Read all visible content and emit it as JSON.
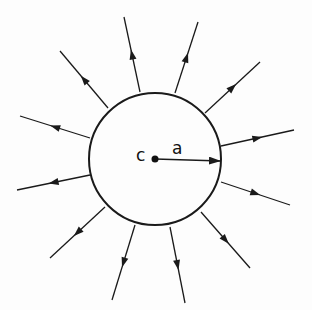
{
  "diagram": {
    "center": {
      "x": 155,
      "y": 159,
      "label": "c"
    },
    "radius": {
      "value": 66,
      "label": "a"
    },
    "colors": {
      "stroke": "#1a1a1a",
      "background": "#fdfdfd"
    },
    "arrows": [
      {
        "x1": 140,
        "y1": 92,
        "x2": 124,
        "y2": 17
      },
      {
        "x1": 175,
        "y1": 93,
        "x2": 198,
        "y2": 22
      },
      {
        "x1": 108,
        "y1": 108,
        "x2": 60,
        "y2": 51
      },
      {
        "x1": 205,
        "y1": 113,
        "x2": 260,
        "y2": 62
      },
      {
        "x1": 90,
        "y1": 138,
        "x2": 20,
        "y2": 116
      },
      {
        "x1": 221,
        "y1": 146,
        "x2": 294,
        "y2": 130
      },
      {
        "x1": 90,
        "y1": 175,
        "x2": 17,
        "y2": 190
      },
      {
        "x1": 221,
        "y1": 182,
        "x2": 290,
        "y2": 205
      },
      {
        "x1": 105,
        "y1": 207,
        "x2": 50,
        "y2": 258
      },
      {
        "x1": 201,
        "y1": 212,
        "x2": 250,
        "y2": 268
      },
      {
        "x1": 135,
        "y1": 225,
        "x2": 112,
        "y2": 300
      },
      {
        "x1": 170,
        "y1": 227,
        "x2": 185,
        "y2": 303
      }
    ]
  }
}
